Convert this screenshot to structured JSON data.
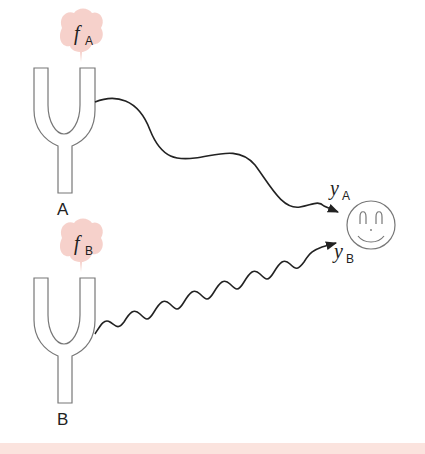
{
  "diagram": {
    "type": "tuning-fork-interference",
    "colors": {
      "stroke": "#222222",
      "fork_outline": "#777777",
      "bubble_fill": "#f4c9c2",
      "bottom_band": "#fbe3de",
      "background": "#ffffff"
    },
    "fork_a": {
      "label": "A",
      "frequency_symbol": "f",
      "frequency_subscript": "A"
    },
    "fork_b": {
      "label": "B",
      "frequency_symbol": "f",
      "frequency_subscript": "B"
    },
    "listener": {
      "icon": "smiley-face-icon",
      "signal_a_symbol": "y",
      "signal_a_subscript": "A",
      "signal_b_symbol": "y",
      "signal_b_subscript": "B"
    },
    "waves": [
      {
        "from": "A",
        "to": "listener",
        "style": "long-wavelength"
      },
      {
        "from": "B",
        "to": "listener",
        "style": "short-wavelength"
      }
    ]
  }
}
